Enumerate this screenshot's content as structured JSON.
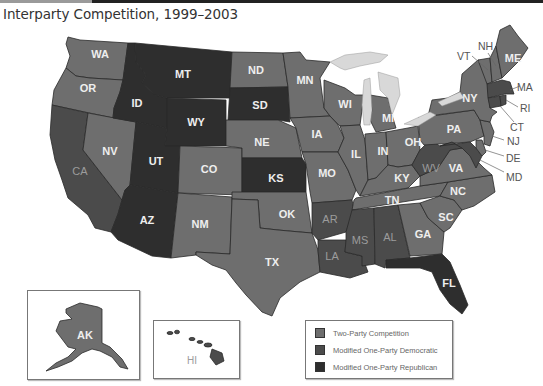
{
  "title": "Interparty Competition, 1999–2003",
  "colors": {
    "two_party": "#6e6e6e",
    "democratic": "#4b4b4b",
    "republican": "#2e2e2e",
    "lakes": "#d8d8d8",
    "background": "#ffffff"
  },
  "legend": {
    "items": [
      {
        "key": "two_party",
        "label": "Two-Party Competition"
      },
      {
        "key": "democratic",
        "label": "Modified One-Party Democratic"
      },
      {
        "key": "republican",
        "label": "Modified One-Party Republican"
      }
    ]
  },
  "states": {
    "WA": {
      "label": "WA",
      "category": "two_party"
    },
    "OR": {
      "label": "OR",
      "category": "two_party"
    },
    "CA": {
      "label": "CA",
      "category": "democratic"
    },
    "NV": {
      "label": "NV",
      "category": "two_party"
    },
    "ID": {
      "label": "ID",
      "category": "republican"
    },
    "MT": {
      "label": "MT",
      "category": "republican"
    },
    "WY": {
      "label": "WY",
      "category": "republican"
    },
    "UT": {
      "label": "UT",
      "category": "republican"
    },
    "AZ": {
      "label": "AZ",
      "category": "republican"
    },
    "CO": {
      "label": "CO",
      "category": "two_party"
    },
    "NM": {
      "label": "NM",
      "category": "two_party"
    },
    "ND": {
      "label": "ND",
      "category": "two_party"
    },
    "SD": {
      "label": "SD",
      "category": "republican"
    },
    "NE": {
      "label": "NE",
      "category": "two_party"
    },
    "KS": {
      "label": "KS",
      "category": "republican"
    },
    "OK": {
      "label": "OK",
      "category": "two_party"
    },
    "TX": {
      "label": "TX",
      "category": "two_party"
    },
    "MN": {
      "label": "MN",
      "category": "two_party"
    },
    "IA": {
      "label": "IA",
      "category": "two_party"
    },
    "MO": {
      "label": "MO",
      "category": "two_party"
    },
    "AR": {
      "label": "AR",
      "category": "democratic"
    },
    "LA": {
      "label": "LA",
      "category": "democratic"
    },
    "WI": {
      "label": "WI",
      "category": "two_party"
    },
    "IL": {
      "label": "IL",
      "category": "two_party"
    },
    "MI": {
      "label": "MI",
      "category": "two_party"
    },
    "IN": {
      "label": "IN",
      "category": "two_party"
    },
    "OH": {
      "label": "OH",
      "category": "two_party"
    },
    "KY": {
      "label": "KY",
      "category": "two_party"
    },
    "TN": {
      "label": "TN",
      "category": "two_party"
    },
    "MS": {
      "label": "MS",
      "category": "democratic"
    },
    "AL": {
      "label": "AL",
      "category": "democratic"
    },
    "GA": {
      "label": "GA",
      "category": "two_party"
    },
    "FL": {
      "label": "FL",
      "category": "republican"
    },
    "SC": {
      "label": "SC",
      "category": "two_party"
    },
    "NC": {
      "label": "NC",
      "category": "two_party"
    },
    "VA": {
      "label": "VA",
      "category": "two_party"
    },
    "WV": {
      "label": "WV",
      "category": "democratic"
    },
    "MD": {
      "label": "MD",
      "category": "democratic"
    },
    "DE": {
      "label": "DE",
      "category": "two_party"
    },
    "NJ": {
      "label": "NJ",
      "category": "two_party"
    },
    "PA": {
      "label": "PA",
      "category": "two_party"
    },
    "NY": {
      "label": "NY",
      "category": "two_party"
    },
    "CT": {
      "label": "CT",
      "category": "democratic"
    },
    "RI": {
      "label": "RI",
      "category": "democratic"
    },
    "MA": {
      "label": "MA",
      "category": "democratic"
    },
    "VT": {
      "label": "VT",
      "category": "two_party"
    },
    "NH": {
      "label": "NH",
      "category": "two_party"
    },
    "ME": {
      "label": "ME",
      "category": "two_party"
    },
    "AK": {
      "label": "AK",
      "category": "two_party"
    },
    "HI": {
      "label": "HI",
      "category": "democratic"
    }
  }
}
